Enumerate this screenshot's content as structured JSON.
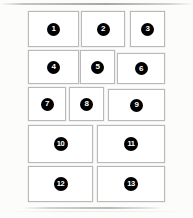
{
  "canvas": {
    "width": 193,
    "height": 218,
    "background_color": "#fcfcfb"
  },
  "style": {
    "panel_fill": "#ffffff",
    "panel_border": "#b9b9b9",
    "badge_fill": "#000000",
    "badge_text_color": "#ffffff"
  },
  "panels": [
    {
      "label": "1",
      "x": 28,
      "y": 11,
      "w": 51,
      "h": 36
    },
    {
      "label": "2",
      "x": 81,
      "y": 11,
      "w": 44,
      "h": 36
    },
    {
      "label": "3",
      "x": 130,
      "y": 11,
      "w": 35,
      "h": 36
    },
    {
      "label": "4",
      "x": 28,
      "y": 50,
      "w": 51,
      "h": 34
    },
    {
      "label": "5",
      "x": 80,
      "y": 50,
      "w": 35,
      "h": 34
    },
    {
      "label": "6",
      "x": 117,
      "y": 53,
      "w": 48,
      "h": 31
    },
    {
      "label": "7",
      "x": 28,
      "y": 87,
      "w": 38,
      "h": 34
    },
    {
      "label": "8",
      "x": 69,
      "y": 87,
      "w": 35,
      "h": 34
    },
    {
      "label": "9",
      "x": 108,
      "y": 89,
      "w": 57,
      "h": 32
    },
    {
      "label": "10",
      "x": 28,
      "y": 125,
      "w": 65,
      "h": 38
    },
    {
      "label": "11",
      "x": 97,
      "y": 125,
      "w": 68,
      "h": 38
    },
    {
      "label": "12",
      "x": 28,
      "y": 166,
      "w": 65,
      "h": 36
    },
    {
      "label": "13",
      "x": 97,
      "y": 166,
      "w": 68,
      "h": 36
    }
  ]
}
